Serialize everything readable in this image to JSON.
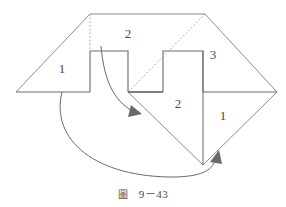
{
  "figure": {
    "caption_mark": "圖",
    "caption_text": "9－43",
    "labels": [
      {
        "id": "label-left-1",
        "text": "1",
        "x": 62,
        "y": 70
      },
      {
        "id": "label-top-2",
        "text": "2",
        "x": 128,
        "y": 35
      },
      {
        "id": "label-right-3",
        "text": "3",
        "x": 213,
        "y": 56
      },
      {
        "id": "label-lower-2",
        "text": "2",
        "x": 178,
        "y": 105
      },
      {
        "id": "label-lower-1",
        "text": "1",
        "x": 223,
        "y": 117
      }
    ],
    "colors": {
      "stroke": "#555555",
      "stroke_light": "#8c8c8c",
      "dotted": "#9a9a9a",
      "arrow": "#6a6a6a",
      "background": "#ffffff",
      "text": "#4a4a4a"
    },
    "geometry": {
      "outline_points": "16,92 90,14 205,14 277,92 203,165",
      "left_baseline": "16,92 90,92",
      "tab_one": "90,92 90,51 128,51 128,92",
      "valley_floor": "128,92 163,92",
      "tab_two": "163,92 163,51 203,51 203,92",
      "right_baseline": "203,92 277,92",
      "diag_left_lower": "203,165 128,92",
      "diag_right_lower": "203,165 277,92",
      "tab_two_stem": "203,51 203,165",
      "fold_dotted_left": "90,14 90,51",
      "fold_dotted_diag": "205,14 128,92"
    },
    "arrows": [
      {
        "id": "arrow-upper-fold",
        "path": "M 101,46 C 104,78 112,100 134,112",
        "head": "131,105 142,114 128,117"
      },
      {
        "id": "arrow-lower-fold",
        "path": "M 62,92 C 50,140 96,178 176,177 C 205,176 213,169 216,158",
        "head": "211,162 218,151 221,164"
      }
    ]
  }
}
